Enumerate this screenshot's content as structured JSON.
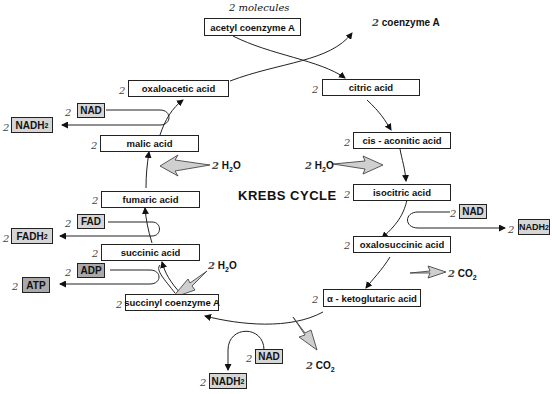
{
  "title": "KREBS CYCLE",
  "input": {
    "count": "2 molecules",
    "label": "acetyl coenzyme A"
  },
  "output_top": {
    "count": "2",
    "label": "coenzyme A"
  },
  "coefficient": "2",
  "intermediates": [
    {
      "id": "citric",
      "label": "citric acid"
    },
    {
      "id": "cis-aconitic",
      "label": "cis - aconitic acid"
    },
    {
      "id": "isocitric",
      "label": "isocitric acid"
    },
    {
      "id": "oxalosuccinic",
      "label": "oxalosuccinic acid"
    },
    {
      "id": "alpha-ketoglutaric",
      "label": "α - ketoglutaric acid"
    },
    {
      "id": "succinyl-coa",
      "label": "succinyl coenzyme A"
    },
    {
      "id": "succinic",
      "label": "succinic acid"
    },
    {
      "id": "fumaric",
      "label": "fumaric acid"
    },
    {
      "id": "malic",
      "label": "malic acid"
    },
    {
      "id": "oxaloacetic",
      "label": "oxaloacetic acid"
    }
  ],
  "cofactors": {
    "nad": "NAD",
    "nadh2": "NADH",
    "fad": "FAD",
    "fadh2": "FADH",
    "adp": "ADP",
    "atp": "ATP",
    "sub2": "2"
  },
  "side_inputs": {
    "h2o": "H",
    "h2o_tail": "O",
    "co2": "CO"
  }
}
